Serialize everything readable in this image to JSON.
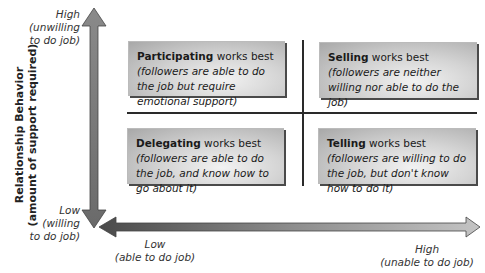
{
  "y_axis": {
    "title_line1": "Relationship Behavior",
    "title_line2": "(amount of support required)",
    "high_label": "High",
    "high_sub1": "(unwilling",
    "high_sub2": "to do job)",
    "low_label": "Low",
    "low_sub1": "(willing",
    "low_sub2": "to do job)"
  },
  "x_axis": {
    "low_label": "Low",
    "low_sub": "(able to do job)",
    "high_label": "High",
    "high_sub": "(unable to do job)"
  },
  "quadrants": {
    "top_left": {
      "style": "Participating",
      "suffix": " works best",
      "desc": "(followers are able to do the job but require emotional support)"
    },
    "top_right": {
      "style": "Selling",
      "suffix": " works best ",
      "desc": "(followers are neither willing nor able to do the job)"
    },
    "bottom_left": {
      "style": "Delegating",
      "suffix": " works best",
      "desc": "(followers are able to do the job, and know how to go about it)"
    },
    "bottom_right": {
      "style": "Telling",
      "suffix": " works best ",
      "desc": "(followers are willing to do the job, but don't know how to do it)"
    }
  },
  "colors": {
    "arrow_dark": "#555555",
    "arrow_light": "#b8b8b8",
    "box_light": "#f2f2f2",
    "box_dark": "#a8a8a8",
    "divider": "#2a2a2a"
  }
}
